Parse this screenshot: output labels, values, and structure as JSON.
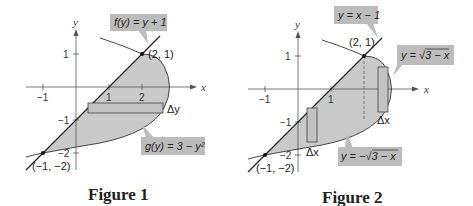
{
  "figures": [
    {
      "caption": "Figure 1",
      "axis_labels": {
        "x": "x",
        "y": "y"
      },
      "x_ticks": [
        "−1",
        "1",
        "2"
      ],
      "y_ticks": [
        "1",
        "−1",
        "−2"
      ],
      "points": [
        {
          "label": "(2, 1)"
        },
        {
          "label": "(−1, −2)"
        }
      ],
      "equations": {
        "line": "f(y) = y + 1",
        "curve": "g(y) = 3 − y²"
      },
      "strip_label": "Δy"
    },
    {
      "caption": "Figure 2",
      "axis_labels": {
        "x": "x",
        "y": "y"
      },
      "x_ticks": [
        "−1",
        "1"
      ],
      "y_ticks": [
        "1",
        "−1",
        "−2"
      ],
      "points": [
        {
          "label": "(2, 1)"
        },
        {
          "label": "(−1, −2)"
        }
      ],
      "equations": {
        "line": "y = x − 1",
        "upper": "y = √3 − x",
        "lower": "y = −√3 − x"
      },
      "strip_labels": [
        "Δx",
        "Δx"
      ]
    }
  ],
  "colors": {
    "region_fill": "#c9c9c9",
    "label_box": "#bcbcbc",
    "curve": "#222222",
    "axis": "#555555"
  }
}
